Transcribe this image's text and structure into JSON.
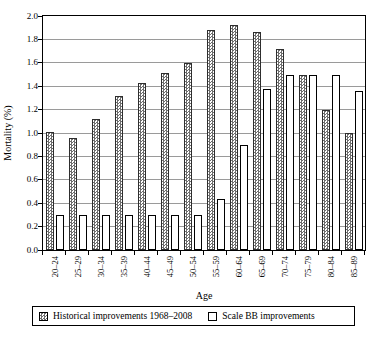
{
  "figure": {
    "background": "#ffffff",
    "border_color": "#000000",
    "gridline_color": "#9a9a9a",
    "hatch_color": "#6e6e6e"
  },
  "chart_data": {
    "type": "bar",
    "title": "",
    "xlabel": "Age",
    "ylabel": "Mortality (%)",
    "ylim": [
      0,
      2.0
    ],
    "ytick_step": 0.2,
    "yticks": [
      "0.0",
      "0.2",
      "0.4",
      "0.6",
      "0.8",
      "1.0",
      "1.2",
      "1.4",
      "1.6",
      "1.8",
      "2.0"
    ],
    "grid": "horizontal",
    "legend_position": "bottom-box",
    "categories": [
      "20–24",
      "25–29",
      "30–34",
      "35–39",
      "40–44",
      "45–49",
      "50–54",
      "55–59",
      "60–64",
      "65–69",
      "70–74",
      "75–79",
      "80–84",
      "85–89"
    ],
    "series": [
      {
        "name": "Historical improvements 1968–2008",
        "style": "hatched",
        "values": [
          1.01,
          0.96,
          1.12,
          1.32,
          1.43,
          1.51,
          1.6,
          1.88,
          1.92,
          1.86,
          1.72,
          1.5,
          1.2,
          1.0
        ]
      },
      {
        "name": "Scale BB improvements",
        "style": "white",
        "values": [
          0.3,
          0.3,
          0.3,
          0.3,
          0.3,
          0.3,
          0.3,
          0.44,
          0.9,
          1.38,
          1.5,
          1.5,
          1.5,
          1.36
        ]
      }
    ]
  }
}
